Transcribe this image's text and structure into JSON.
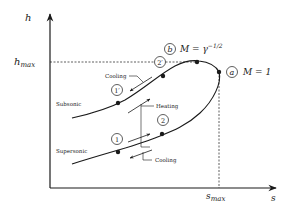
{
  "diagram": {
    "type": "Rayleigh line h-s diagram",
    "axes": {
      "y_label": "h",
      "x_label": "s",
      "y_mark_label": "h",
      "y_mark_sub": "max",
      "x_mark_label": "s",
      "x_mark_sub": "max"
    },
    "points": {
      "a": {
        "id": "a",
        "label": "M = 1"
      },
      "b": {
        "id": "b",
        "label_prefix": "M = γ",
        "label_sup": "−1/2"
      },
      "p1": "1",
      "p2": "2",
      "p1p": "1′",
      "p2p": "2′"
    },
    "branches": {
      "subsonic": "Subsonic",
      "supersonic": "Supersonic"
    },
    "processes": {
      "cooling_top": "Cooling",
      "heating": "Heating",
      "cooling_bottom": "Cooling"
    },
    "colors": {
      "ink": "#1a1a1a",
      "background": "#ffffff"
    }
  }
}
